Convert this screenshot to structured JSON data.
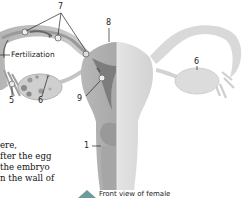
{
  "diagram": {
    "caption": "Front view of female",
    "labels": {
      "fertilization": "Fertilization",
      "n7": "7",
      "n8": "8",
      "n6_left": "6",
      "n6_right": "6",
      "n5": "5",
      "n9": "9",
      "n1": "1"
    },
    "colors": {
      "tissue_light": "#d9d9d9",
      "tissue_mid": "#bfbfbf",
      "tissue_dark": "#8c8c8c",
      "arrow": "#6e9a9a"
    }
  },
  "body_text": {
    "lines": [
      "ere,",
      "fter the egg",
      " the embryo",
      "n the wall of"
    ]
  }
}
